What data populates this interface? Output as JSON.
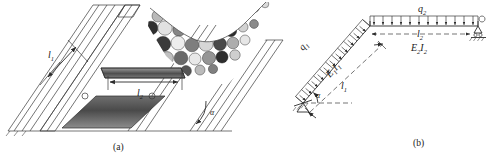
{
  "figure": {
    "panels": [
      {
        "id": "a",
        "caption": "(a)",
        "description": "pictorial view of an inclined slope with debris / rubble retained by a bracing frame",
        "labels": [
          {
            "name": "length-l1",
            "text": "l",
            "sub": "1"
          },
          {
            "name": "length-l2",
            "text": "l",
            "sub": "2"
          },
          {
            "name": "angle-alpha",
            "text": "α",
            "sub": ""
          }
        ]
      },
      {
        "id": "b",
        "caption": "(b)",
        "description": "structural analysis model: inclined member with distributed load q1 and horizontal member with distributed load q2",
        "labels": [
          {
            "name": "load-q1",
            "text": "q",
            "sub": "1"
          },
          {
            "name": "load-q2",
            "text": "q",
            "sub": "2"
          },
          {
            "name": "stiffness-e1i1",
            "text": "E₁I₁",
            "sub": ""
          },
          {
            "name": "stiffness-e2i2",
            "text": "E₂I₂",
            "sub": ""
          },
          {
            "name": "length-l1",
            "text": "l",
            "sub": "1"
          },
          {
            "name": "length-l2",
            "text": "l",
            "sub": "2"
          },
          {
            "name": "angle-alpha",
            "text": "α",
            "sub": ""
          }
        ]
      }
    ]
  },
  "panel_a": {
    "caption": "(a)",
    "label_l1": "l",
    "label_l1_sub": "1",
    "label_l2": "l",
    "label_l2_sub": "2",
    "label_alpha": "α"
  },
  "panel_b": {
    "caption": "(b)",
    "label_q1": "q",
    "label_q1_sub": "1",
    "label_q2": "q",
    "label_q2_sub": "2",
    "label_e1i1_e": "E",
    "label_e1i1_e_sub": "1",
    "label_e1i1_i": "I",
    "label_e1i1_i_sub": "1",
    "label_e2i2_e": "E",
    "label_e2i2_e_sub": "2",
    "label_e2i2_i": "I",
    "label_e2i2_i_sub": "2",
    "label_l1": "l",
    "label_l1_sub": "1",
    "label_l2": "l",
    "label_l2_sub": "2",
    "label_alpha": "α"
  },
  "colors": {
    "ink": "#2b2b2b",
    "background": "#ffffff",
    "shade_dark": "#3f3f3f",
    "shade_mid": "#8a8a8a",
    "shade_light": "#d9d9d9"
  }
}
